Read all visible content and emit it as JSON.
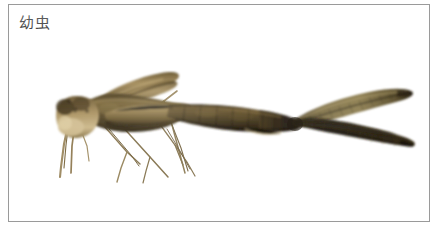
{
  "figure": {
    "caption": "幼虫",
    "caption_color": "#2b2b2b",
    "background_color": "#ffffff",
    "frame_border_color": "#9a9a9a",
    "width_px": 440,
    "height_px": 231
  },
  "photo": {
    "subject_name": "damselfly-larva",
    "alt_text": "幼虫",
    "background_color": "#ffffff",
    "palette": {
      "body_dark": "#2a2115",
      "body_mid": "#6b5732",
      "body_light": "#b6a072",
      "head_pale": "#cdb98c",
      "lamella_light": "#8a7a4e",
      "lamella_dark": "#231c11",
      "leg_line": "#8d7e5c",
      "highlight": "#e4d9b6"
    },
    "parts": [
      {
        "name": "head",
        "label": "头部"
      },
      {
        "name": "thorax",
        "label": "胸部"
      },
      {
        "name": "wing-pads",
        "label": "翅芽"
      },
      {
        "name": "abdomen",
        "label": "腹部"
      },
      {
        "name": "caudal-lamella-upper",
        "label": "上尾鳃"
      },
      {
        "name": "caudal-lamella-lower",
        "label": "下尾鳃"
      },
      {
        "name": "legs",
        "label": "足"
      }
    ]
  }
}
